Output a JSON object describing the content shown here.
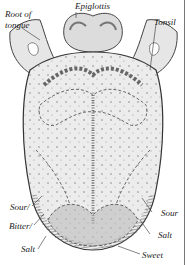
{
  "diagram": {
    "labels": {
      "root_of_tongue_line1": "Root of",
      "root_of_tongue_line2": "tongue",
      "epiglottis": "Epiglottis",
      "tonsil": "Tonsil",
      "sour_left": "Sour/",
      "bitter": "Bitter/",
      "salt_left": "Salt",
      "sour_right": "Sour",
      "salt_right": "Salt",
      "sweet": "Sweet"
    },
    "colors": {
      "ink": "#333333",
      "paper": "#ffffff",
      "shade_light": "#e4e4e4",
      "shade_mid": "#c8c8c8",
      "shade_dark": "#9a9a9a"
    }
  }
}
